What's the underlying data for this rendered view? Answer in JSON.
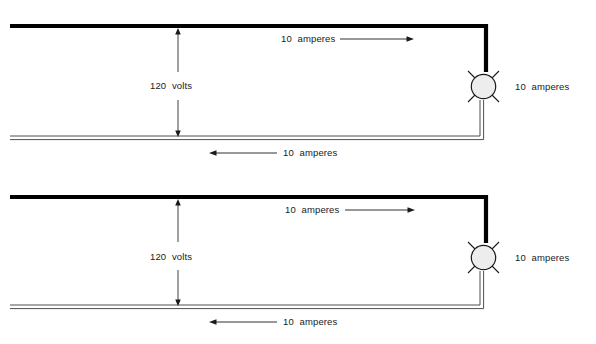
{
  "diagram": {
    "type": "electrical-circuit",
    "repeat_count": 2,
    "colors": {
      "hot_conductor": "#000000",
      "neutral_conductor": "#555555",
      "lamp_fill": "#ededed",
      "lamp_stroke": "#1a1a1a",
      "text": "#1a1a1a",
      "background": "#ffffff"
    },
    "panels": [
      {
        "id": "panel-top",
        "voltage_label": "120  volts",
        "supply_current_label": "10  amperes",
        "return_current_label": "10  amperes",
        "lamp_current_label": "10  amperes",
        "supply_arrow_direction": "right",
        "return_arrow_direction": "left",
        "voltage_arrow_direction": "both",
        "lamp_symbol": "incandescent-lamp"
      },
      {
        "id": "panel-bottom",
        "voltage_label": "120  volts",
        "supply_current_label": "10  amperes",
        "return_current_label": "10  amperes",
        "lamp_current_label": "10  amperes",
        "supply_arrow_direction": "right",
        "return_arrow_direction": "left",
        "voltage_arrow_direction": "both",
        "lamp_symbol": "incandescent-lamp"
      }
    ]
  }
}
